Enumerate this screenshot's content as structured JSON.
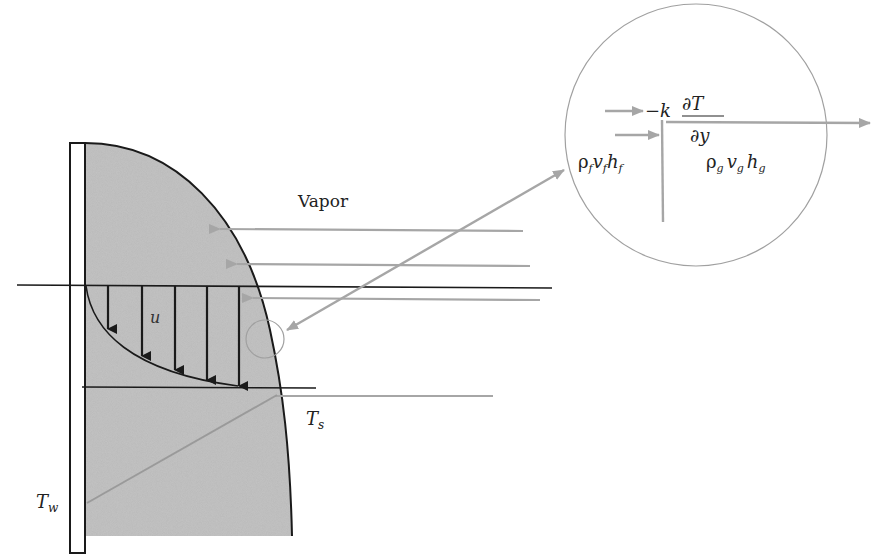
{
  "diagram": {
    "colors": {
      "film_fill": "#b8b8b8",
      "outline": "#1a1a1a",
      "arrow_gray": "#a6a6a6",
      "circle": "#a0a0a0",
      "background": "#ffffff"
    },
    "labels": {
      "vapor": "Vapor",
      "velocity": "u",
      "interface_temp_main": "T",
      "interface_temp_sub": "s",
      "wall_temp_main": "T",
      "wall_temp_sub": "w"
    },
    "inset": {
      "conduction_prefix": "−k",
      "conduction_num": "∂T",
      "conduction_den": "∂y",
      "liquid_flux": {
        "rho": "ρ",
        "rho_sub": "f",
        "v": "v",
        "v_sub": "f",
        "h": "h",
        "h_sub": "f"
      },
      "vapor_flux": {
        "rho": "ρ",
        "rho_sub": "g",
        "v": "v",
        "v_sub": "g",
        "h": "h",
        "h_sub": "g"
      }
    },
    "elements": {
      "wall": "Vertical wall (white strip)",
      "film": "Condensate liquid film (gray region)",
      "vapor_arrows": 3,
      "velocity_arrows": 5,
      "zoom_circle": "Magnified interface control volume"
    }
  }
}
